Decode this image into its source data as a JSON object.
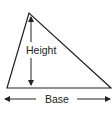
{
  "diagram": {
    "shape": "triangle",
    "labels": {
      "height": "Height",
      "base": "Base"
    },
    "colors": {
      "stroke": "#222222",
      "background": "#ffffff"
    }
  }
}
